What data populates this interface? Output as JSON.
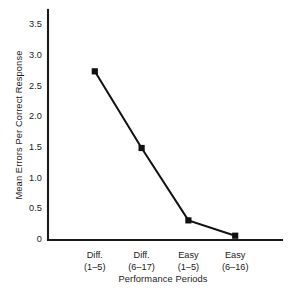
{
  "chart_data": {
    "type": "line",
    "title": "",
    "xlabel": "Performance Periods",
    "ylabel": "Mean Errors Per Correct Response",
    "categories": [
      "Diff.\n(1–5)",
      "Diff.\n(6–17)",
      "Easy\n(1–5)",
      "Easy\n(6–16)"
    ],
    "category_lines": [
      {
        "line1": "Diff.",
        "line2": "(1–5)"
      },
      {
        "line1": "Diff.",
        "line2": "(6–17)"
      },
      {
        "line1": "Easy",
        "line2": "(1–5)"
      },
      {
        "line1": "Easy",
        "line2": "(6–16)"
      }
    ],
    "values": [
      2.75,
      1.5,
      0.32,
      0.07
    ],
    "ylim": [
      0,
      3.75
    ],
    "yticks": [
      0,
      0.5,
      1.0,
      1.5,
      2.0,
      2.5,
      3.0,
      3.5
    ],
    "ytick_labels": [
      "0",
      "0.5",
      "1.0",
      "1.5",
      "2.0",
      "2.5",
      "3.0",
      "3.5"
    ],
    "grid": false,
    "legend": "none",
    "marker": "square",
    "line_color": "#111111",
    "marker_color": "#111111",
    "axis_color": "#1a1a1a",
    "background_color": "#ffffff"
  }
}
